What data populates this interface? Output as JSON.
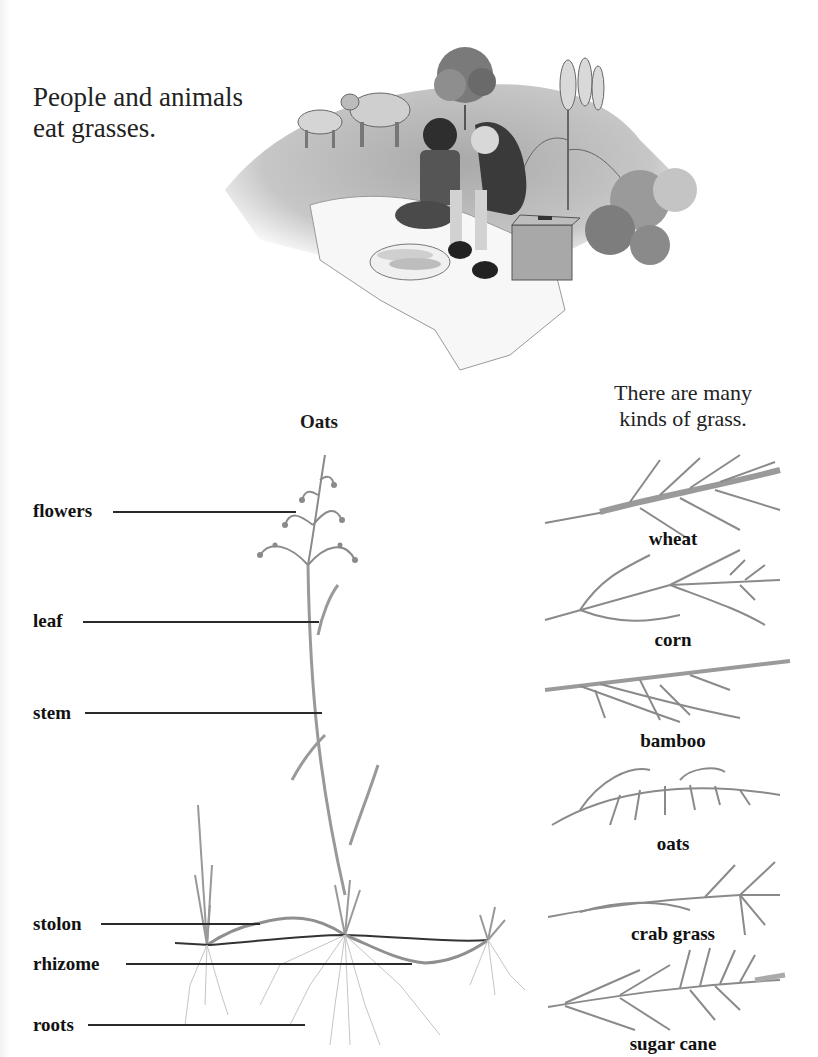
{
  "intro_text": {
    "line1": "People and animals",
    "line2": "eat grasses."
  },
  "picnic_illustration": {
    "description": "Two children eating corn on a picnic blanket with cows, a tree, corn plants and a wicker basket"
  },
  "kinds_text": {
    "line1": "There are many",
    "line2": "kinds of grass."
  },
  "diagram": {
    "title": "Oats",
    "labels": {
      "flowers": "flowers",
      "leaf": "leaf",
      "stem": "stem",
      "stolon": "stolon",
      "rhizome": "rhizome",
      "roots": "roots"
    }
  },
  "grass_kinds": [
    {
      "label": "wheat"
    },
    {
      "label": "corn"
    },
    {
      "label": "bamboo"
    },
    {
      "label": "oats"
    },
    {
      "label": "crab grass"
    },
    {
      "label": "sugar cane"
    }
  ],
  "colors": {
    "text": "#1a1a1a",
    "line": "#2a2a2a",
    "sketch": "#888888"
  }
}
